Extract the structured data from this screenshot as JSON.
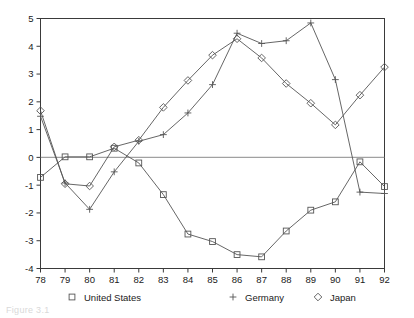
{
  "chart_data": {
    "type": "line",
    "title": "",
    "subtitle": "",
    "xlabel": "",
    "ylabel": "",
    "x": [
      "78",
      "79",
      "80",
      "81",
      "82",
      "83",
      "84",
      "85",
      "86",
      "87",
      "88",
      "89",
      "90",
      "91",
      "92"
    ],
    "categories": [
      "78",
      "79",
      "80",
      "81",
      "82",
      "83",
      "84",
      "85",
      "86",
      "87",
      "88",
      "89",
      "90",
      "91",
      "92"
    ],
    "xlim": [
      78,
      92
    ],
    "ylim": [
      -4,
      5
    ],
    "yticks": [
      "5",
      "4",
      "3",
      "2",
      "1",
      "0",
      "-1",
      "-2",
      "-3",
      "-4"
    ],
    "ytick_values": [
      5,
      4,
      3,
      2,
      1,
      0,
      -1,
      -2,
      -3,
      -4
    ],
    "grid": false,
    "zero_line": true,
    "legend_position": "bottom",
    "series": [
      {
        "name": "United States",
        "marker": "square",
        "values": [
          -0.72,
          0.02,
          0.02,
          0.33,
          -0.2,
          -1.34,
          -2.76,
          -3.03,
          -3.5,
          -3.58,
          -2.65,
          -1.9,
          -1.6,
          -0.16,
          -1.05
        ]
      },
      {
        "name": "Germany",
        "marker": "plus",
        "values": [
          1.48,
          -0.92,
          -1.87,
          -0.52,
          0.58,
          0.82,
          1.6,
          2.62,
          4.47,
          4.1,
          4.2,
          4.84,
          2.8,
          -1.25,
          -1.3
        ]
      },
      {
        "name": "Japan",
        "marker": "diamond",
        "values": [
          1.68,
          -0.95,
          -1.03,
          0.38,
          0.62,
          1.8,
          2.77,
          3.68,
          4.27,
          3.58,
          2.66,
          1.95,
          1.17,
          2.24,
          3.25
        ]
      }
    ]
  },
  "axis": {
    "y_tick_labels": [
      "5",
      "4",
      "3",
      "2",
      "1",
      "0",
      "-1",
      "-2",
      "-3",
      "-4"
    ],
    "x_tick_labels": [
      "78",
      "79",
      "80",
      "81",
      "82",
      "83",
      "84",
      "85",
      "86",
      "87",
      "88",
      "89",
      "90",
      "91",
      "92"
    ]
  },
  "legend": {
    "items": [
      {
        "label": "United States",
        "marker": "square-marker"
      },
      {
        "label": "Germany",
        "marker": "plus-marker"
      },
      {
        "label": "Japan",
        "marker": "diamond-marker"
      }
    ]
  },
  "caption": {
    "text": "Figure 3.1"
  }
}
